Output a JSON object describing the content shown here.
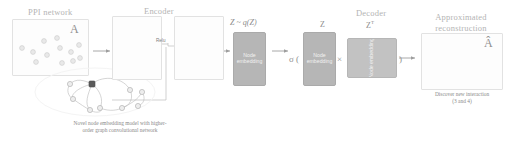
{
  "figure": {
    "type": "pipeline-diagram",
    "topic": "Graph autoencoder for PPI network link prediction",
    "background_color": "#ffffff",
    "ink_color": "#9a9a9a",
    "box_fill": "#b6b6b6"
  },
  "panels": {
    "input": {
      "title": "PPI network",
      "matrix_label": "A",
      "node_count": 12
    },
    "encoder": {
      "title": "Encoder",
      "activation_label": "Relu",
      "cluster_left_nodes": 26,
      "cluster_right_nodes": 26
    },
    "latent": {
      "label": "Z ~ q(Z)",
      "box_text": "Node\nembedding"
    },
    "decoder": {
      "title": "Decoder",
      "sigma_open": "σ (",
      "z_label": "Z",
      "z_box_text": "Node\nembedding",
      "multiply": "×",
      "zt_label": "Z",
      "zt_superscript": "T",
      "zt_box_text": "Node embedding",
      "paren_close": ")"
    },
    "output": {
      "title": "Approximated\nreconstruction",
      "matrix_label": "Â",
      "node_count": 11,
      "note": "Discover new interaction\n(3 and 4)"
    }
  },
  "captions": {
    "gcn_model": "Novel node embedding model with higher-\norder graph convolutional network"
  },
  "arrows": [
    {
      "name": "input-to-encoder"
    },
    {
      "name": "encoder-to-latent"
    },
    {
      "name": "latent-to-decoder"
    },
    {
      "name": "decoder-to-output"
    }
  ]
}
